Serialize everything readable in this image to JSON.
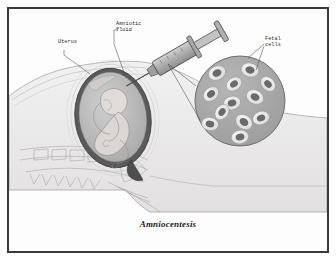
{
  "figure": {
    "caption": "Amniocentesis",
    "frame_color": "#3a3a3a",
    "background_color": "#fdfdfd"
  },
  "labels": {
    "uterus": "Uterus",
    "amniotic_fluid": "Amniotic\nfluid",
    "fetal_cells": "Fetal\ncells"
  },
  "palette": {
    "body_fill": "#eceaea",
    "body_outline": "#9a9a9a",
    "uterus_wall": "#4a4a4a",
    "amniotic_fluid_fill": "#bdbdbd",
    "fetus_fill": "#d8d6d4",
    "fetus_outline": "#8a8a8a",
    "inset_fill": "#a8a8a8",
    "inset_outline": "#6e6e6e",
    "cell_ring": "#e8e8e8",
    "cell_nucleus": "#6a6a6a",
    "syringe_body": "#b5b5b5",
    "syringe_outline": "#4a4a4a",
    "leader_line": "#4a4a4a"
  },
  "anatomy": {
    "inset_circle": {
      "cx": 240,
      "cy": 101,
      "r": 45,
      "cell_count": 12
    },
    "uterus_oval": {
      "cx": 113,
      "cy": 118,
      "rx": 37,
      "ry": 49
    },
    "syringe_angle_deg": -30,
    "vertebrae_count": 5
  }
}
